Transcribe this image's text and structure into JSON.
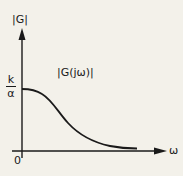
{
  "diagram": {
    "y_axis_label": "|G|",
    "x_axis_label": "ω",
    "origin_label": "0",
    "curve_label": "|G(jω)|",
    "level_label": {
      "numerator": "k",
      "denominator": "α"
    },
    "colors": {
      "ink": "#1a1a1a",
      "paper": "#f3f1ea"
    }
  }
}
